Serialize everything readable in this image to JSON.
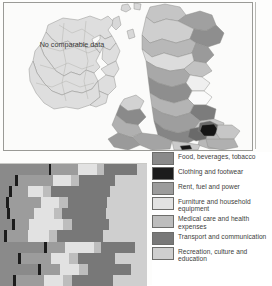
{
  "map": {
    "annotation": "No comparable data",
    "frame_color": "#9a9a96",
    "background": "#fbfbfa",
    "outline_color": "#8b8b88"
  },
  "legend": {
    "items": [
      {
        "label": "Food, beverages, tobacco",
        "color": "#8a8a8a"
      },
      {
        "label": "Clothing and footwear",
        "color": "#1c1c1c"
      },
      {
        "label": "Rent, fuel and power",
        "color": "#9c9c9c"
      },
      {
        "label": "Furniture and household equipment",
        "color": "#e2e2e2"
      },
      {
        "label": "Medical care and health expenses",
        "color": "#bdbdbd"
      },
      {
        "label": "Transport and communication",
        "color": "#787878"
      },
      {
        "label": "Recreation, culture and education",
        "color": "#cfcfcf"
      }
    ]
  },
  "chart_data": {
    "type": "bar",
    "orientation": "horizontal",
    "stacked": true,
    "title": "",
    "xlabel": "",
    "ylabel": "",
    "note": "Stacked horizontal bar chart, cropped at left and right edges; category shares per region.",
    "categories": [
      "Food, beverages, tobacco",
      "Clothing and footwear",
      "Rent, fuel and power",
      "Furniture and household equipment",
      "Medical care and health expenses",
      "Transport and communication",
      "Recreation, culture and education"
    ],
    "series_colors": [
      "#8a8a8a",
      "#1c1c1c",
      "#9c9c9c",
      "#e2e2e2",
      "#bdbdbd",
      "#787878",
      "#cfcfcf"
    ],
    "rows": [
      {
        "values": [
          33,
          2,
          18,
          13,
          5,
          22,
          7
        ]
      },
      {
        "values": [
          10,
          2,
          24,
          12,
          6,
          24,
          22
        ]
      },
      {
        "values": [
          6,
          2,
          11,
          10,
          6,
          40,
          25
        ]
      },
      {
        "values": [
          4,
          2,
          22,
          12,
          6,
          27,
          27
        ]
      },
      {
        "values": [
          5,
          2,
          16,
          14,
          5,
          30,
          28
        ]
      },
      {
        "values": [
          8,
          2,
          10,
          23,
          6,
          25,
          26
        ]
      },
      {
        "values": [
          3,
          2,
          14,
          14,
          6,
          31,
          30
        ]
      },
      {
        "values": [
          30,
          2,
          12,
          20,
          5,
          23,
          8
        ]
      },
      {
        "values": [
          12,
          2,
          21,
          12,
          6,
          25,
          22
        ]
      },
      {
        "values": [
          26,
          2,
          13,
          13,
          6,
          29,
          11
        ]
      },
      {
        "values": [
          9,
          2,
          19,
          13,
          6,
          28,
          23
        ]
      }
    ]
  }
}
